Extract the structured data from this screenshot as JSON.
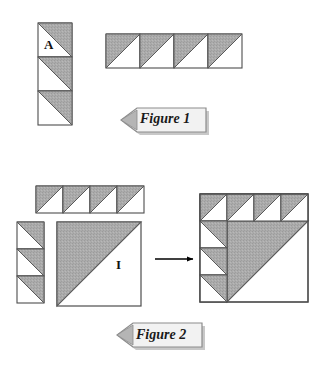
{
  "document": {
    "title": "Triangle Tile Assembly Figures",
    "background_color": "#ffffff",
    "width": 327,
    "height": 365
  },
  "style": {
    "shade_fill": "#a8a8a8",
    "shade_fill_light": "#b4b4b4",
    "white_fill": "#ffffff",
    "outline_color": "#4d4d4d",
    "outline_color_dark": "#333333",
    "arrow_color": "#000000",
    "banner_fill": "#f2f2f2",
    "banner_edge": "#8c8c8c",
    "banner_shadow": "#9a9a9a",
    "text_color": "#111111"
  },
  "figures": [
    {
      "id": "figure-1",
      "banner_label": "Figure 1",
      "caption_position": "below-right",
      "pieces": [
        {
          "id": "fig1-column",
          "name": "vertical-tile-column",
          "shape": "column",
          "cell_count": 3,
          "cell_size": 34,
          "origin": {
            "x": 38,
            "y": 23
          },
          "diagonal": "tl-br",
          "shaded_half": "upper-right",
          "letter": "A",
          "letter_cell_index": 0
        },
        {
          "id": "fig1-strip",
          "name": "horizontal-tile-strip",
          "shape": "row",
          "cell_count": 4,
          "cell_size": 34,
          "origin": {
            "x": 106,
            "y": 34
          },
          "diagonal": "tr-bl",
          "shaded_half": "upper-left",
          "letter": null
        }
      ]
    },
    {
      "id": "figure-2",
      "banner_label": "Figure 2",
      "caption_position": "below-center",
      "pieces": [
        {
          "id": "fig2-strip",
          "name": "horizontal-tile-strip",
          "shape": "row",
          "cell_count": 4,
          "cell_size": 27,
          "origin": {
            "x": 36,
            "y": 186
          },
          "diagonal": "tr-bl",
          "shaded_half": "upper-left",
          "letter": null
        },
        {
          "id": "fig2-column",
          "name": "vertical-tile-column",
          "shape": "column",
          "cell_count": 3,
          "cell_size": 27,
          "origin": {
            "x": 17,
            "y": 222
          },
          "diagonal": "tl-br",
          "shaded_half": "upper-right",
          "letter": null
        },
        {
          "id": "fig2-big-square",
          "name": "large-half-shaded-square",
          "shape": "square",
          "size": 84,
          "origin": {
            "x": 57,
            "y": 222
          },
          "diagonal": "tr-bl",
          "shaded_half": "upper-left",
          "letter": "I"
        },
        {
          "id": "fig2-arrow",
          "name": "transformation-arrow",
          "shape": "arrow-right",
          "from": {
            "x": 155,
            "y": 259
          },
          "to": {
            "x": 196,
            "y": 259
          }
        },
        {
          "id": "fig2-result",
          "name": "assembled-result-square",
          "shape": "composite-square",
          "size": 108,
          "cell_size": 27,
          "grid": 4,
          "origin": {
            "x": 200,
            "y": 194
          },
          "description": "Top row of four upper-left-shaded triangles, left column of three upper-right-shaded triangles, and a large rotated shaded triangle filling the interior."
        }
      ]
    }
  ],
  "annotations": {
    "letter_a": "A",
    "letter_i": "I",
    "figure_1_caption": "Figure 1",
    "figure_2_caption": "Figure 2"
  }
}
